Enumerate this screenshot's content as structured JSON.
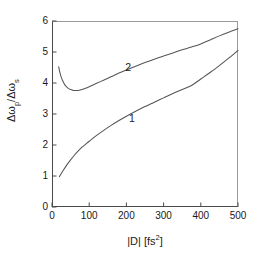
{
  "chart_data": {
    "type": "line",
    "title": "",
    "subtitle": "",
    "xlabel": "|D|  [fs2]",
    "xlabel_base": "|D|  [fs",
    "xlabel_exp": "2",
    "xlabel_close": "]",
    "ylabel_num_delta": "Δω",
    "ylabel_num_sub": "p",
    "ylabel_slash": "/",
    "ylabel_den_delta": "Δω",
    "ylabel_den_sub": "s",
    "ylabel": "Δωp/Δωs",
    "xlim": [
      0,
      500
    ],
    "ylim": [
      0,
      6
    ],
    "xticks": [
      0,
      100,
      200,
      300,
      400,
      500
    ],
    "yticks": [
      0,
      1,
      2,
      3,
      4,
      5,
      6
    ],
    "grid": false,
    "legend": "none",
    "line_color": "#555555",
    "axis_color": "#4a4a4a",
    "series": [
      {
        "name": "1",
        "label_x": 215,
        "label_y": 2.84,
        "x": [
          20,
          30,
          40,
          50,
          60,
          70,
          80,
          90,
          100,
          120,
          140,
          160,
          180,
          200,
          225,
          250,
          275,
          300,
          325,
          350,
          375,
          400,
          425,
          450,
          475,
          500
        ],
        "values": [
          0.98,
          1.18,
          1.36,
          1.52,
          1.67,
          1.8,
          1.92,
          2.02,
          2.12,
          2.31,
          2.48,
          2.64,
          2.79,
          2.93,
          3.09,
          3.24,
          3.38,
          3.52,
          3.66,
          3.79,
          3.92,
          4.13,
          4.34,
          4.56,
          4.8,
          5.05
        ]
      },
      {
        "name": "2",
        "label_x": 205,
        "label_y": 4.49,
        "x": [
          18,
          22,
          26,
          30,
          35,
          40,
          45,
          50,
          55,
          60,
          70,
          80,
          90,
          100,
          120,
          140,
          160,
          180,
          200,
          225,
          250,
          275,
          300,
          325,
          350,
          375,
          400,
          425,
          450,
          475,
          500
        ],
        "values": [
          4.52,
          4.3,
          4.15,
          4.04,
          3.93,
          3.87,
          3.82,
          3.79,
          3.77,
          3.76,
          3.76,
          3.79,
          3.83,
          3.88,
          3.99,
          4.1,
          4.21,
          4.32,
          4.42,
          4.54,
          4.66,
          4.77,
          4.87,
          4.97,
          5.07,
          5.16,
          5.26,
          5.39,
          5.52,
          5.64,
          5.75
        ]
      }
    ]
  }
}
